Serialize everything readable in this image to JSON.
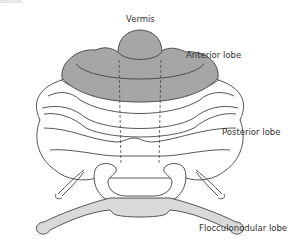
{
  "diagram": {
    "title_fragment": "Below:",
    "labels": {
      "vermis": "Vermis",
      "anterior_lobe": "Anterior lobe",
      "posterior_lobe": "Posterior lobe",
      "flocculonodular_lobe": "Flocculonodular lobe"
    },
    "colors": {
      "anterior_fill": "#a6a6a6",
      "flocculonodular_fill": "#d9d9d9",
      "posterior_fill": "#ffffff",
      "outline": "#444444",
      "text": "#333333"
    }
  }
}
